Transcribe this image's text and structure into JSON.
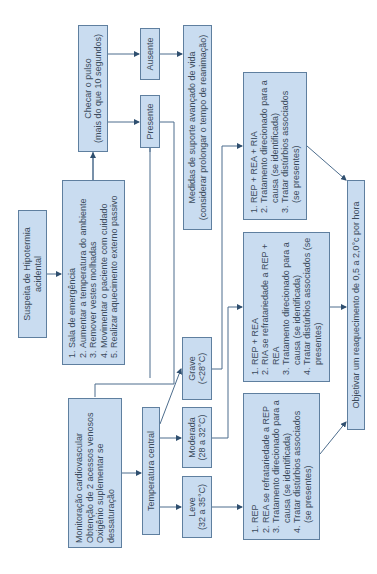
{
  "diagram": {
    "title": "Suspeita de Hipotermia acidental",
    "nodes": {
      "suspeita": {
        "lines": [
          "Suspeita de Hipotermia",
          "acidental"
        ]
      },
      "medidas_iniciais": {
        "items": [
          "Sala de emergência",
          "Aumentar a temperatura do ambiente",
          "Remover vestes molhadas",
          "Movimentar o paciente com cuidado",
          "Realizar aquecimento externo passivo"
        ]
      },
      "checar_pulso": {
        "lines": [
          "Checar o pulso",
          "(mais do que 10 segundos)"
        ]
      },
      "ausente": {
        "label": "Ausente"
      },
      "presente": {
        "label": "Presente"
      },
      "suporte_avancado": {
        "lines": [
          "Medidas de suporte avançado de vida",
          "(considerar prolongar o tempo de reanimação)"
        ]
      },
      "monitoracao": {
        "lines": [
          "Monitoração cardiovascular",
          "Obtenção de 2 acessos venosos",
          "Oxigênio suplementar se",
          "dessaturação"
        ]
      },
      "temperatura_central": {
        "label": "Temperatura central"
      },
      "grave": {
        "lines": [
          "Grave",
          "(<28°C)"
        ]
      },
      "moderada": {
        "lines": [
          "Moderada",
          "(28 a 32°C)"
        ]
      },
      "leve": {
        "lines": [
          "Leve",
          "(32 a 35°C)"
        ]
      },
      "tratamento_grave": {
        "items": [
          "REP + REA + RIA",
          "Tratamento direcionado para a causa (se identificada)",
          "Tratar distúrbios associados (se presentes)"
        ]
      },
      "tratamento_moderada": {
        "items": [
          "REP + REA",
          "RIA se refratariedade a REP + REA",
          "Tratamento direcionado para a causa (se identificada)",
          "Tratar distúrbios associados (se presentes)"
        ]
      },
      "tratamento_leve": {
        "items": [
          "REP",
          "REA se refratariedade a REP",
          "Tratamento direcionado para a causa (se identificada)",
          "Tratar distúrbios associados (se presentes)"
        ]
      },
      "objetivo": {
        "label": "Objetivar um reaquecimento de 0,5 a 2,0°c por hora"
      }
    },
    "colors": {
      "box_fill": "#c9dcf0",
      "box_border": "#5f7f9f",
      "arrow": "#4d6d8d",
      "text": "#3b4b5c"
    }
  }
}
